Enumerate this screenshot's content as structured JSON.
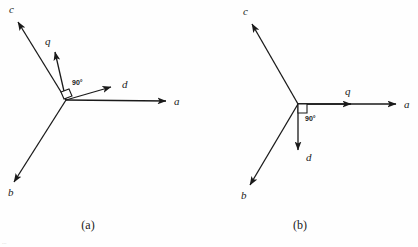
{
  "figure": {
    "canvas": {
      "width": 418,
      "height": 247,
      "background": "#fefefe"
    },
    "stroke_color": "#1a1a1a",
    "text_color": "#1a1a1a",
    "edge_fragment": "..."
  },
  "panels": [
    {
      "id": "panel-a",
      "caption": "(a)",
      "caption_x": 88,
      "caption_y": 229,
      "origin": {
        "x": 66,
        "y": 100
      },
      "right_angle": {
        "label": "90°",
        "label_x": 72,
        "label_y": 85,
        "marker_points": "61,92 69,89 72,96 64,99"
      },
      "vectors": [
        {
          "name": "a",
          "label": "a",
          "tip_x": 166,
          "tip_y": 101,
          "label_x": 174,
          "label_y": 105
        },
        {
          "name": "b",
          "label": "b",
          "tip_x": 14,
          "tip_y": 182,
          "label_x": 8,
          "label_y": 196
        },
        {
          "name": "c",
          "label": "c",
          "tip_x": 18,
          "tip_y": 22,
          "label_x": 9,
          "label_y": 13
        },
        {
          "name": "d",
          "label": "d",
          "tip_x": 111,
          "tip_y": 87,
          "label_x": 122,
          "label_y": 88
        },
        {
          "name": "q",
          "label": "q",
          "tip_x": 55,
          "tip_y": 52,
          "label_x": 45,
          "label_y": 45
        }
      ]
    },
    {
      "id": "panel-b",
      "caption": "(b)",
      "caption_x": 300,
      "caption_y": 229,
      "origin": {
        "x": 298,
        "y": 104
      },
      "right_angle": {
        "label": "90°",
        "label_x": 305,
        "label_y": 119,
        "marker_points": "298,104 306,104 306,112 298,112"
      },
      "vectors": [
        {
          "name": "a",
          "label": "a",
          "tip_x": 396,
          "tip_y": 104,
          "label_x": 404,
          "label_y": 108
        },
        {
          "name": "b",
          "label": "b",
          "tip_x": 250,
          "tip_y": 185,
          "label_x": 241,
          "label_y": 199
        },
        {
          "name": "c",
          "label": "c",
          "tip_x": 252,
          "tip_y": 24,
          "label_x": 243,
          "label_y": 15
        },
        {
          "name": "d",
          "label": "d",
          "tip_x": 298,
          "tip_y": 150,
          "label_x": 306,
          "label_y": 161
        },
        {
          "name": "q",
          "label": "q",
          "tip_x": 351,
          "tip_y": 104,
          "label_x": 345,
          "label_y": 95
        }
      ]
    }
  ]
}
